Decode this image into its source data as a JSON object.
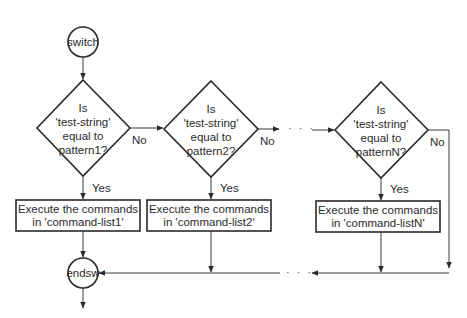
{
  "diagram": {
    "type": "flowchart",
    "start": {
      "label": "switch"
    },
    "end": {
      "label": "endsw"
    },
    "decisions": [
      {
        "line1": "Is",
        "line2": "'test-string'",
        "line3": "equal to",
        "line4": "pattern1?",
        "yes": "Yes",
        "no": "No"
      },
      {
        "line1": "Is",
        "line2": "'test-string'",
        "line3": "equal to",
        "line4": "pattern2?",
        "yes": "Yes",
        "no": "No"
      },
      {
        "line1": "Is",
        "line2": "'test-string'",
        "line3": "equal to",
        "line4": "patternN?",
        "yes": "Yes",
        "no": "No"
      }
    ],
    "actions": [
      {
        "line1": "Execute the commands",
        "line2": "in 'command-list1'"
      },
      {
        "line1": "Execute the commands",
        "line2": "in 'command-list2'"
      },
      {
        "line1": "Execute the commands",
        "line2": "in 'command-listN'"
      }
    ],
    "ellipsis": "· · ·"
  }
}
